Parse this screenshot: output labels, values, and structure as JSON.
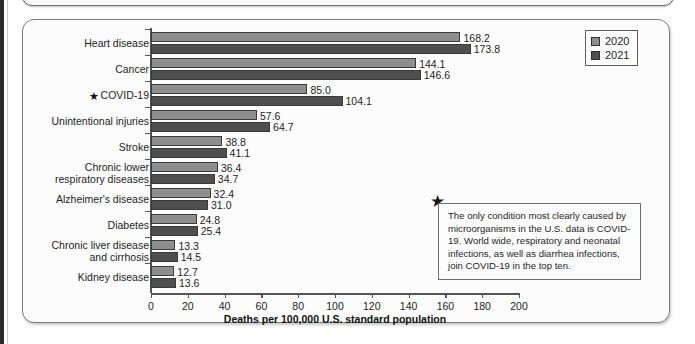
{
  "chart_data": {
    "type": "bar",
    "orientation": "horizontal",
    "title": "",
    "xlabel": "Deaths per 100,000 U.S. standard population",
    "ylabel": "",
    "xlim": [
      0,
      200
    ],
    "xticks": [
      0,
      20,
      40,
      60,
      80,
      100,
      120,
      140,
      160,
      180,
      200
    ],
    "grid": false,
    "legend_position": "top-right",
    "categories": [
      "Heart disease",
      "Cancer",
      "COVID-19",
      "Unintentional injuries",
      "Stroke",
      "Chronic lower respiratory diseases",
      "Alzheimer's disease",
      "Diabetes",
      "Chronic liver disease and cirrhosis",
      "Kidney disease"
    ],
    "series": [
      {
        "name": "2020",
        "color": "#8e8e8e",
        "values": [
          168.2,
          144.1,
          85.0,
          57.6,
          38.8,
          36.4,
          32.4,
          24.8,
          13.3,
          12.7
        ]
      },
      {
        "name": "2021",
        "color": "#4f4f4f",
        "values": [
          173.8,
          146.6,
          104.1,
          64.7,
          41.1,
          34.7,
          31.0,
          25.4,
          14.5,
          13.6
        ]
      }
    ],
    "annotations": [
      {
        "marker": "star",
        "text": "The only condition most clearly caused by microorganisms in the U.S. data is COVID-19. World wide, respiratory and neonatal infections, as well as diarrhea infections, join COVID-19 in the top ten."
      }
    ]
  },
  "rows": [
    {
      "label_lines": [
        "Heart disease"
      ],
      "starred": false,
      "v2020": "168.2",
      "v2021": "173.8",
      "n2020": 168.2,
      "n2021": 173.8
    },
    {
      "label_lines": [
        "Cancer"
      ],
      "starred": false,
      "v2020": "144.1",
      "v2021": "146.6",
      "n2020": 144.1,
      "n2021": 146.6
    },
    {
      "label_lines": [
        "COVID-19"
      ],
      "starred": true,
      "v2020": "85.0",
      "v2021": "104.1",
      "n2020": 85.0,
      "n2021": 104.1
    },
    {
      "label_lines": [
        "Unintentional injuries"
      ],
      "starred": false,
      "v2020": "57.6",
      "v2021": "64.7",
      "n2020": 57.6,
      "n2021": 64.7
    },
    {
      "label_lines": [
        "Stroke"
      ],
      "starred": false,
      "v2020": "38.8",
      "v2021": "41.1",
      "n2020": 38.8,
      "n2021": 41.1
    },
    {
      "label_lines": [
        "Chronic lower",
        "respiratory diseases"
      ],
      "starred": false,
      "v2020": "36.4",
      "v2021": "34.7",
      "n2020": 36.4,
      "n2021": 34.7
    },
    {
      "label_lines": [
        "Alzheimer's disease"
      ],
      "starred": false,
      "v2020": "32.4",
      "v2021": "31.0",
      "n2020": 32.4,
      "n2021": 31.0
    },
    {
      "label_lines": [
        "Diabetes"
      ],
      "starred": false,
      "v2020": "24.8",
      "v2021": "25.4",
      "n2020": 24.8,
      "n2021": 25.4
    },
    {
      "label_lines": [
        "Chronic liver disease",
        "and cirrhosis"
      ],
      "starred": false,
      "v2020": "13.3",
      "v2021": "14.5",
      "n2020": 13.3,
      "n2021": 14.5
    },
    {
      "label_lines": [
        "Kidney disease"
      ],
      "starred": false,
      "v2020": "12.7",
      "v2021": "13.6",
      "n2020": 12.7,
      "n2021": 13.6
    }
  ],
  "legend": {
    "items": [
      {
        "label": "2020",
        "color": "#8e8e8e"
      },
      {
        "label": "2021",
        "color": "#4f4f4f"
      }
    ]
  },
  "annotation": {
    "star_glyph": "★",
    "text": "The only condition most clearly caused by microorganisms in the U.S. data is COVID-19. World wide, respiratory and neonatal infections, as well as diarrhea infections, join COVID-19 in the top ten."
  },
  "axis": {
    "title": "Deaths per 100,000 U.S. standard population",
    "ticks": [
      "0",
      "20",
      "40",
      "60",
      "80",
      "100",
      "120",
      "140",
      "160",
      "180",
      "200"
    ]
  },
  "icons": {
    "star": "★"
  }
}
